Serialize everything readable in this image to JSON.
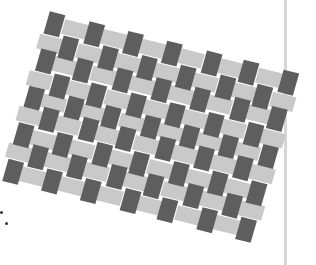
{
  "image": {
    "description": "Photograph of a woven paper-strip checkerboard pattern, rotated, on white background",
    "colors": {
      "background": "#ffffff",
      "dark_strip": "#5e5e5e",
      "light_strip": "#c9c9c9",
      "rule_line": "#d6d6d6",
      "dot": "#333333"
    },
    "weave": {
      "columns": 13,
      "rows": 9,
      "rotation_deg": 14
    },
    "marks": [
      {
        "x": 1,
        "y": 212
      },
      {
        "x": 6,
        "y": 223
      }
    ]
  }
}
